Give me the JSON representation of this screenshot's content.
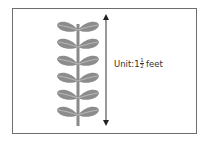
{
  "figure": {
    "label": {
      "prefix": "Unit: ",
      "whole": "1",
      "numerator": "1",
      "denominator": "2",
      "suffix": "feet"
    },
    "plant": {
      "leaf_pairs": 6,
      "leaf_color": "#8c8c8c",
      "leaf_vein_color": "#b5b5b5",
      "stem_color": "#8a8a8a"
    },
    "arrow": {
      "direction": "vertical-double-headed",
      "color": "#333333"
    },
    "frame_border_color": "#6e6e6e"
  }
}
